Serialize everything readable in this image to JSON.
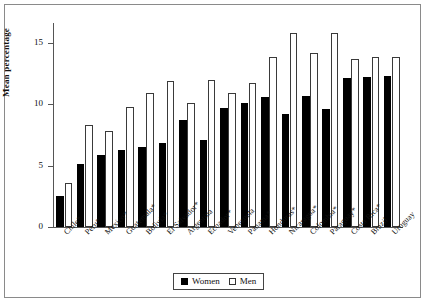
{
  "chart_data": {
    "type": "bar",
    "title": "",
    "xlabel": "",
    "ylabel": "Mean percentage",
    "ylim": [
      0,
      16.6
    ],
    "yticks": [
      0,
      5,
      10,
      15
    ],
    "grid": false,
    "legend_position": "bottom",
    "categories": [
      "Chile*",
      "Peru*",
      "Mexico*",
      "Guatemala*",
      "Bolivia*",
      "El Salvador*",
      "Argentina",
      "Ecuador*",
      "Venezuela",
      "Panama*",
      "Honduras*",
      "Nicaragua*",
      "Colombia*",
      "Paraguay*",
      "Costa Rica*",
      "Brazil",
      "Uruguay"
    ],
    "series": [
      {
        "name": "Women",
        "color": "#000000",
        "values": [
          2.5,
          5.1,
          5.9,
          6.3,
          6.5,
          6.8,
          8.7,
          7.1,
          9.7,
          10.1,
          10.6,
          9.2,
          10.7,
          9.6,
          12.1,
          12.2,
          12.3
        ]
      },
      {
        "name": "Men",
        "color": "#ffffff",
        "values": [
          3.6,
          8.3,
          7.8,
          9.8,
          10.9,
          11.9,
          10.1,
          12.0,
          10.9,
          11.7,
          13.8,
          15.8,
          14.2,
          15.8,
          13.7,
          13.8,
          13.8
        ]
      }
    ]
  },
  "legend": {
    "women_label": "Women",
    "men_label": "Men"
  }
}
